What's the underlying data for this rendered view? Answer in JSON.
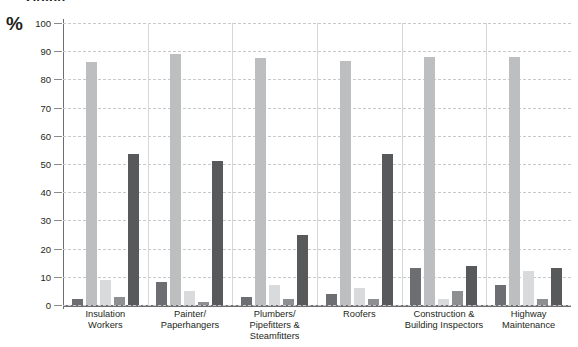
{
  "title_clipped": "Graph",
  "axis": {
    "y_unit_label": "%",
    "y_ticks": [
      0,
      10,
      20,
      30,
      40,
      50,
      60,
      70,
      80,
      90,
      100
    ]
  },
  "colors": {
    "series1": "#6d6e71",
    "series2": "#bcbec0",
    "series3": "#d9dadb",
    "series4": "#8d8f91",
    "series5": "#58595b",
    "gridline": "#c9c9c9",
    "axis": "#6d6e71",
    "text": "#231f20"
  },
  "chart_data": {
    "type": "bar",
    "title": "Graph",
    "xlabel": "",
    "ylabel": "%",
    "ylim": [
      0,
      100
    ],
    "ytick_step": 10,
    "grid": true,
    "legend": false,
    "legend_position": "none",
    "categories": [
      "Insulation Workers",
      "Painter/ Paperhangers",
      "Plumbers/ Pipefitters & Steamfitters",
      "Roofers",
      "Construction & Building Inspectors",
      "Highway Maintenance"
    ],
    "categories_lines": [
      [
        "Insulation",
        "Workers"
      ],
      [
        "Painter/",
        "Paperhangers"
      ],
      [
        "Plumbers/",
        "Pipefitters &",
        "Steamfitters"
      ],
      [
        "Roofers"
      ],
      [
        "Construction &",
        "Building Inspectors"
      ],
      [
        "Highway",
        "Maintenance"
      ]
    ],
    "series": [
      {
        "name": "Series 1",
        "color": "#6d6e71",
        "values": [
          2,
          8,
          3,
          4,
          13,
          7
        ]
      },
      {
        "name": "Series 2",
        "color": "#bcbec0",
        "values": [
          86,
          89,
          87.5,
          86.5,
          88,
          88
        ]
      },
      {
        "name": "Series 3",
        "color": "#d9dadb",
        "values": [
          9,
          5,
          7,
          6,
          2,
          12
        ]
      },
      {
        "name": "Series 4",
        "color": "#8d8f91",
        "values": [
          3,
          1,
          2,
          2,
          5,
          2
        ]
      },
      {
        "name": "Series 5",
        "color": "#58595b",
        "values": [
          53.5,
          51,
          25,
          53.5,
          14,
          13
        ]
      }
    ]
  }
}
